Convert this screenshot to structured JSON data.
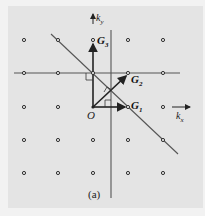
{
  "figure": {
    "caption": "(a)",
    "origin_label": "O",
    "axes": {
      "x_label": "k",
      "x_sub": "x",
      "y_label": "k",
      "y_sub": "y"
    },
    "vectors": [
      {
        "name": "G",
        "sub": "1",
        "from": [
          0,
          0
        ],
        "to": [
          1,
          0
        ]
      },
      {
        "name": "G",
        "sub": "2",
        "from": [
          0,
          0
        ],
        "to": [
          1,
          1
        ]
      },
      {
        "name": "G",
        "sub": "3",
        "from": [
          0,
          0
        ],
        "to": [
          0,
          2
        ]
      }
    ],
    "lattice": {
      "columns": [
        -2,
        -1,
        0,
        1,
        2
      ],
      "rows": [
        2,
        1,
        0,
        -1,
        -2
      ]
    },
    "colors": {
      "background": "#e4e4e4",
      "ink": "#222222",
      "points": "#333333"
    }
  }
}
